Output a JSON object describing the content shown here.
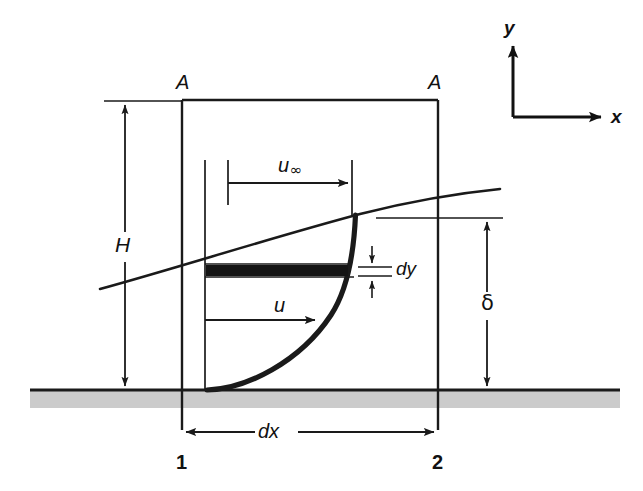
{
  "figure": {
    "background_color": "#ffffff",
    "line_color": "#1a1a1a",
    "wall_fill_color": "#c8c8c8",
    "strip_fill_color": "#111111"
  },
  "labels": {
    "control_surface_left": "A",
    "control_surface_right": "A",
    "height": "H",
    "bl_thickness": "δ",
    "dx": "dx",
    "dy": "dy",
    "velocity": "u",
    "freestream_symbol": "u",
    "freestream_subscript": "∞",
    "station_left": "1",
    "station_right": "2",
    "axis_y": "y",
    "axis_x": "x"
  },
  "geometry": {
    "control_volume": {
      "left_x": 182,
      "right_x": 438,
      "top_y": 100,
      "bottom_y": 430
    },
    "wall": {
      "y": 390,
      "x_start": 30,
      "x_end": 620,
      "band_height": 18
    },
    "boundary_layer_edge": {
      "x_start": 100,
      "y_start": 289,
      "x_end": 500,
      "y_end": 190
    },
    "velocity_profile": {
      "base_x": 207,
      "base_y": 390,
      "top_x": 355,
      "top_y": 215,
      "axis_x": 205
    },
    "freestream_arrow": {
      "y": 183,
      "x_start": 228,
      "x_end": 352
    },
    "velocity_arrow": {
      "y": 320,
      "x_start": 205,
      "x_end": 318
    },
    "dy_strip": {
      "y_top": 265,
      "y_bottom": 276,
      "x_start": 206,
      "x_end": 348
    },
    "height_dimension": {
      "x": 125,
      "y_top": 101,
      "y_bottom": 390
    },
    "delta_dimension": {
      "x": 487,
      "y_top": 218,
      "y_bottom": 390
    },
    "dx_dimension": {
      "y": 432,
      "x_start": 182,
      "x_end": 438
    },
    "axes_origin": {
      "x": 513,
      "y": 117
    }
  }
}
